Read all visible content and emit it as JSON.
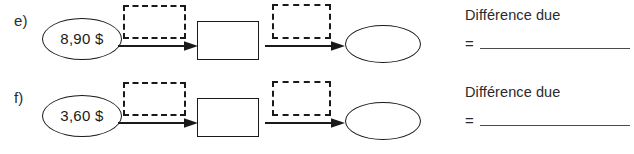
{
  "worksheet": {
    "background_color": "#ffffff",
    "ink_color": "#1a1a1a",
    "rows": [
      {
        "label": "e)",
        "start_value": "8,90 $",
        "operation_box_1": "",
        "intermediate_value": "",
        "operation_box_2": "",
        "result_value": "",
        "answer_caption": "Différence due",
        "equals_sign": "=",
        "answer_value": ""
      },
      {
        "label": "f)",
        "start_value": "3,60 $",
        "operation_box_1": "",
        "intermediate_value": "",
        "operation_box_2": "",
        "result_value": "",
        "answer_caption": "Différence due",
        "equals_sign": "=",
        "answer_value": ""
      }
    ],
    "icons": {
      "arrow": "arrow-right-icon"
    }
  }
}
